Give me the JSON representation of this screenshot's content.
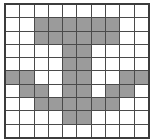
{
  "figure": {
    "name": "pixel-grid",
    "type": "binary-raster-grid",
    "rows": 10,
    "cols": 10,
    "colors": {
      "filled": "#9b9b9b",
      "empty": "#ffffff",
      "gridline": "#4a4a4a",
      "border": "#3c3c3c",
      "background": "#ffffff"
    },
    "legend": {
      "filled_label": "filled",
      "empty_label": "empty"
    },
    "cells": [
      [
        0,
        0,
        0,
        0,
        0,
        0,
        0,
        0,
        0,
        0
      ],
      [
        0,
        0,
        1,
        1,
        1,
        1,
        1,
        1,
        0,
        0
      ],
      [
        0,
        0,
        1,
        1,
        1,
        1,
        1,
        1,
        0,
        0
      ],
      [
        0,
        0,
        0,
        0,
        1,
        1,
        0,
        0,
        0,
        0
      ],
      [
        0,
        0,
        0,
        0,
        1,
        1,
        0,
        0,
        0,
        0
      ],
      [
        1,
        1,
        0,
        0,
        1,
        1,
        0,
        0,
        1,
        1
      ],
      [
        0,
        1,
        1,
        0,
        1,
        1,
        0,
        1,
        1,
        0
      ],
      [
        0,
        0,
        1,
        1,
        1,
        1,
        1,
        1,
        0,
        0
      ],
      [
        0,
        0,
        0,
        0,
        1,
        1,
        0,
        0,
        0,
        0
      ],
      [
        0,
        0,
        0,
        0,
        0,
        0,
        0,
        0,
        0,
        0
      ]
    ],
    "filled_count": 38,
    "total_count": 100
  }
}
